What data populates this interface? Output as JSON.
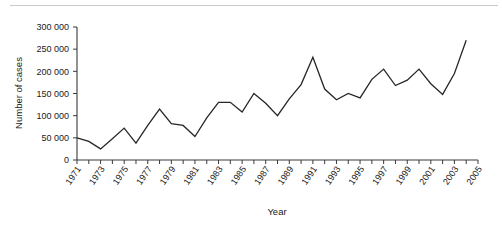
{
  "chart_data": {
    "type": "line",
    "title": "",
    "xlabel": "Year",
    "ylabel": "Number of cases",
    "xlim": [
      1971,
      2005
    ],
    "ylim": [
      0,
      300000
    ],
    "grid": false,
    "legend": null,
    "y_ticks": [
      0,
      50000,
      100000,
      150000,
      200000,
      250000,
      300000
    ],
    "y_tick_labels": [
      "0",
      "50 000",
      "100 000",
      "150 000",
      "200 000",
      "250 000",
      "300 000"
    ],
    "x_ticks": [
      1971,
      1973,
      1975,
      1977,
      1979,
      1981,
      1983,
      1985,
      1987,
      1989,
      1991,
      1993,
      1995,
      1997,
      1999,
      2001,
      2003,
      2005
    ],
    "x_tick_labels": [
      "1971",
      "1973",
      "1975",
      "1977",
      "1979",
      "1981",
      "1983",
      "1985",
      "1987",
      "1989",
      "1991",
      "1993",
      "1995",
      "1997",
      "1999",
      "2001",
      "2003",
      "2005"
    ],
    "x_minor_ticks": [
      1972,
      1974,
      1976,
      1978,
      1980,
      1982,
      1984,
      1986,
      1988,
      1990,
      1992,
      1994,
      1996,
      1998,
      2000,
      2002,
      2004
    ],
    "series": [
      {
        "name": "Number of cases",
        "color": "#262626",
        "x": [
          1971,
          1972,
          1973,
          1974,
          1975,
          1976,
          1977,
          1978,
          1979,
          1980,
          1981,
          1982,
          1983,
          1984,
          1985,
          1986,
          1987,
          1988,
          1989,
          1990,
          1991,
          1992,
          1993,
          1994,
          1995,
          1996,
          1997,
          1998,
          1999,
          2000,
          2001,
          2002,
          2003,
          2004
        ],
        "values": [
          50000,
          42000,
          25000,
          48000,
          72000,
          38000,
          78000,
          115000,
          82000,
          78000,
          53000,
          95000,
          130000,
          130000,
          108000,
          150000,
          128000,
          100000,
          138000,
          170000,
          232000,
          160000,
          136000,
          150000,
          140000,
          182000,
          205000,
          168000,
          180000,
          205000,
          172000,
          148000,
          195000,
          270000
        ]
      }
    ]
  },
  "axes": {
    "y_axis_title": "Number of cases",
    "x_axis_title": "Year"
  }
}
